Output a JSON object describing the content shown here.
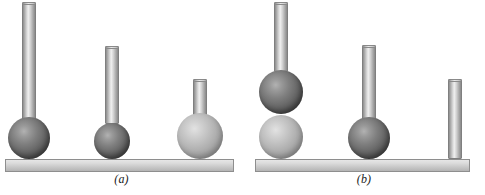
{
  "figure": {
    "type": "physics-illustration",
    "background_color": "#ffffff",
    "panels": [
      {
        "id": "a",
        "label": "(a)",
        "plank": {
          "x": 5,
          "y": 159,
          "width": 229,
          "height": 13,
          "color": "#d2d2d2"
        },
        "assemblies": [
          {
            "name": "assembly-a1",
            "rod": {
              "cx": 29,
              "top": 2,
              "width": 14,
              "height": 120,
              "color": "#c8c8c8"
            },
            "balls": [
              {
                "cx": 29,
                "cy": 138,
                "r": 21,
                "shade": "dark",
                "color": "#5a5a5a"
              }
            ]
          },
          {
            "name": "assembly-a2",
            "rod": {
              "cx": 112,
              "top": 46,
              "width": 14,
              "height": 78,
              "color": "#c8c8c8"
            },
            "balls": [
              {
                "cx": 112,
                "cy": 141,
                "r": 18,
                "shade": "dark",
                "color": "#5a5a5a"
              }
            ]
          },
          {
            "name": "assembly-a3",
            "rod": {
              "cx": 200,
              "top": 79,
              "width": 14,
              "height": 38,
              "color": "#c8c8c8"
            },
            "balls": [
              {
                "cx": 200,
                "cy": 136,
                "r": 23,
                "shade": "light",
                "color": "#a8a8a8"
              }
            ]
          }
        ]
      },
      {
        "id": "b",
        "label": "(b)",
        "plank": {
          "x": 255,
          "y": 159,
          "width": 215,
          "height": 13,
          "color": "#d2d2d2"
        },
        "assemblies": [
          {
            "name": "assembly-b1",
            "rod": {
              "cx": 281,
              "top": 2,
              "width": 14,
              "height": 70,
              "color": "#c8c8c8"
            },
            "balls": [
              {
                "cx": 281,
                "cy": 92,
                "r": 22,
                "shade": "dark",
                "color": "#5a5a5a"
              },
              {
                "cx": 281,
                "cy": 137,
                "r": 22,
                "shade": "light",
                "color": "#a8a8a8"
              }
            ]
          },
          {
            "name": "assembly-b2",
            "rod": {
              "cx": 369,
              "top": 45,
              "width": 14,
              "height": 78,
              "color": "#c8c8c8"
            },
            "balls": [
              {
                "cx": 369,
                "cy": 138,
                "r": 21,
                "shade": "dark",
                "color": "#5a5a5a"
              }
            ]
          },
          {
            "name": "assembly-b3",
            "rod": {
              "cx": 455,
              "top": 79,
              "width": 14,
              "height": 80,
              "color": "#c8c8c8"
            },
            "balls": []
          }
        ]
      }
    ]
  }
}
